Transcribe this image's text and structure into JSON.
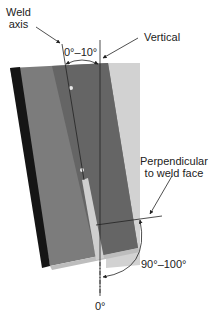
{
  "labels": {
    "weld_axis_line1": "Weld",
    "weld_axis_line2": "axis",
    "vertical": "Vertical",
    "tilt_range": "0°–10°",
    "perpendicular_line1": "Perpendicular",
    "perpendicular_line2": "to weld face",
    "rotation_range": "90°–100°",
    "zero": "0°"
  },
  "colors": {
    "plate_face_left": "#8a8a8a",
    "plate_face_mid": "#6e6e6e",
    "plate_edge_dark": "#1a1a1a",
    "plate_light_side": "#d0d0d0",
    "weld_bead": "#c8c8c8",
    "line": "#222222"
  }
}
